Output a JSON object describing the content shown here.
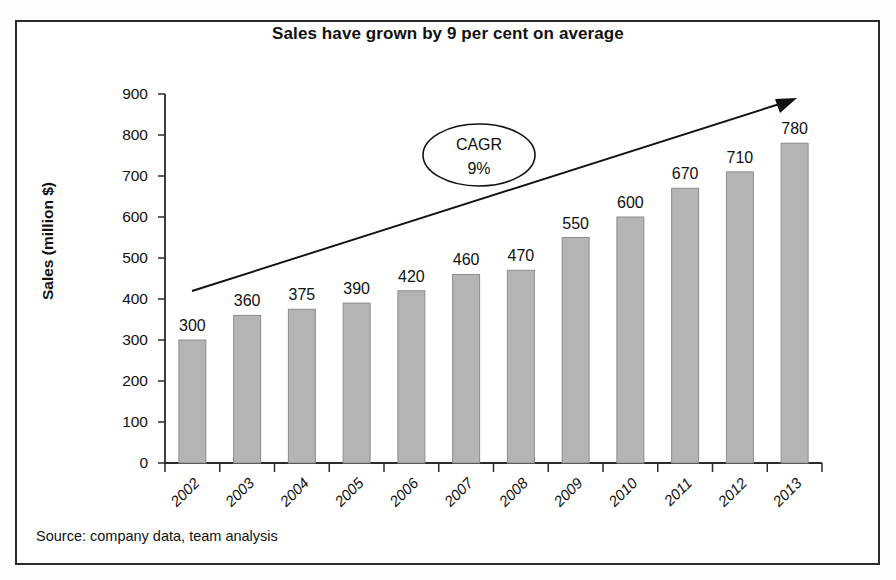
{
  "figure": {
    "title": "Sales have grown by 9 per cent on average",
    "source_note": "Source: company data, team analysis"
  },
  "chart_data": {
    "type": "bar",
    "title": "Sales have grown by 9 per cent on average",
    "xlabel": "",
    "ylabel": "Sales (million $)",
    "categories": [
      "2002",
      "2003",
      "2004",
      "2005",
      "2006",
      "2007",
      "2008",
      "2009",
      "2010",
      "2011",
      "2012",
      "2013"
    ],
    "values": [
      300,
      360,
      375,
      390,
      420,
      460,
      470,
      550,
      600,
      670,
      710,
      780
    ],
    "data_labels": [
      "300",
      "360",
      "375",
      "390",
      "420",
      "460",
      "470",
      "550",
      "600",
      "670",
      "710",
      "780"
    ],
    "ylim": [
      0,
      900
    ],
    "yticks": [
      0,
      100,
      200,
      300,
      400,
      500,
      600,
      700,
      800,
      900
    ],
    "ytick_labels": [
      "0",
      "100",
      "200",
      "300",
      "400",
      "500",
      "600",
      "700",
      "800",
      "900"
    ],
    "grid": false,
    "legend": "none",
    "bar_color": "#b4b4b4",
    "bar_edge_color": "#8c8c8c",
    "annotations": [
      {
        "name": "cagr-callout",
        "shape": "ellipse",
        "line1": "CAGR",
        "line2": "9%"
      },
      {
        "name": "growth-trend-arrow",
        "shape": "arrow",
        "from_value": 400,
        "to_value": 870
      }
    ]
  },
  "colors": {
    "frame": "#2b2b2b",
    "axis": "#2b2b2b",
    "text": "#111111",
    "background": "#ffffff"
  }
}
